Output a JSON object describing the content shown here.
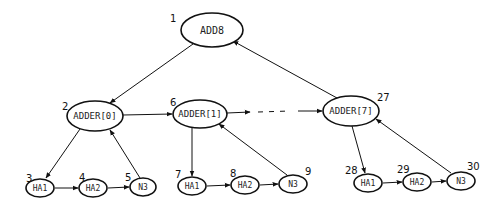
{
  "diagram": {
    "nodes": [
      {
        "id": "add8",
        "label": "ADD8",
        "number": "1",
        "cx": 212,
        "cy": 30,
        "rx": 31,
        "ry": 17,
        "num_x": 170,
        "num_y": 22,
        "font": 10
      },
      {
        "id": "adder0",
        "label": "ADDER[0]",
        "number": "2",
        "cx": 95,
        "cy": 116,
        "rx": 28,
        "ry": 15,
        "num_x": 62,
        "num_y": 110,
        "font": 9
      },
      {
        "id": "adder1",
        "label": "ADDER[1]",
        "number": "6",
        "cx": 200,
        "cy": 114,
        "rx": 27,
        "ry": 14,
        "num_x": 170,
        "num_y": 106,
        "font": 9
      },
      {
        "id": "adder7",
        "label": "ADDER[7]",
        "number": "27",
        "cx": 351,
        "cy": 111,
        "rx": 28,
        "ry": 15,
        "num_x": 377,
        "num_y": 101,
        "font": 9
      },
      {
        "id": "ha1_0",
        "label": "HA1",
        "number": "3",
        "cx": 40,
        "cy": 188,
        "rx": 14,
        "ry": 9,
        "num_x": 26,
        "num_y": 182,
        "font": 8
      },
      {
        "id": "ha2_0",
        "label": "HA2",
        "number": "4",
        "cx": 93,
        "cy": 188,
        "rx": 14,
        "ry": 9,
        "num_x": 79,
        "num_y": 181,
        "font": 8
      },
      {
        "id": "n3_0",
        "label": "N3",
        "number": "5",
        "cx": 143,
        "cy": 187,
        "rx": 13,
        "ry": 9,
        "num_x": 125,
        "num_y": 181,
        "font": 8
      },
      {
        "id": "ha1_1",
        "label": "HA1",
        "number": "7",
        "cx": 192,
        "cy": 186,
        "rx": 14,
        "ry": 9,
        "num_x": 175,
        "num_y": 178,
        "font": 8
      },
      {
        "id": "ha2_1",
        "label": "HA2",
        "number": "8",
        "cx": 245,
        "cy": 185,
        "rx": 14,
        "ry": 9,
        "num_x": 230,
        "num_y": 177,
        "font": 8
      },
      {
        "id": "n3_1",
        "label": "N3",
        "number": "9",
        "cx": 293,
        "cy": 184,
        "rx": 14,
        "ry": 9,
        "num_x": 305,
        "num_y": 175,
        "font": 8
      },
      {
        "id": "ha1_7",
        "label": "HA1",
        "number": "28",
        "cx": 368,
        "cy": 183,
        "rx": 14,
        "ry": 9,
        "num_x": 345,
        "num_y": 174,
        "font": 8
      },
      {
        "id": "ha2_7",
        "label": "HA2",
        "number": "29",
        "cx": 417,
        "cy": 182,
        "rx": 14,
        "ry": 9,
        "num_x": 397,
        "num_y": 173,
        "font": 8
      },
      {
        "id": "n3_7",
        "label": "N3",
        "number": "30",
        "cx": 461,
        "cy": 181,
        "rx": 14,
        "ry": 9,
        "num_x": 467,
        "num_y": 170,
        "font": 8
      }
    ],
    "edges": [
      {
        "from": "add8",
        "to": "adder0",
        "x1": 193,
        "y1": 44,
        "x2": 110,
        "y2": 103,
        "style": "solid"
      },
      {
        "from": "adder7",
        "to": "add8",
        "x1": 337,
        "y1": 98,
        "x2": 233,
        "y2": 41,
        "style": "solid"
      },
      {
        "from": "adder0",
        "to": "adder1",
        "x1": 123,
        "y1": 115,
        "x2": 172,
        "y2": 114,
        "style": "solid"
      },
      {
        "from": "adder1",
        "to": "dots",
        "x1": 227,
        "y1": 113,
        "x2": 250,
        "y2": 112,
        "style": "solid"
      },
      {
        "from": "dots",
        "to": "dots2",
        "x1": 258,
        "y1": 112,
        "x2": 290,
        "y2": 111,
        "style": "dashed"
      },
      {
        "from": "dots",
        "to": "adder7",
        "x1": 298,
        "y1": 111,
        "x2": 322,
        "y2": 111,
        "style": "solid"
      },
      {
        "from": "adder0",
        "to": "ha1_0",
        "x1": 80,
        "y1": 129,
        "x2": 46,
        "y2": 178,
        "style": "solid"
      },
      {
        "from": "ha1_0",
        "to": "ha2_0",
        "x1": 55,
        "y1": 188,
        "x2": 78,
        "y2": 188,
        "style": "solid"
      },
      {
        "from": "ha2_0",
        "to": "n3_0",
        "x1": 108,
        "y1": 188,
        "x2": 129,
        "y2": 187,
        "style": "solid"
      },
      {
        "from": "n3_0",
        "to": "adder0",
        "x1": 140,
        "y1": 178,
        "x2": 110,
        "y2": 130,
        "style": "solid"
      },
      {
        "from": "adder1",
        "to": "ha1_1",
        "x1": 192,
        "y1": 128,
        "x2": 192,
        "y2": 176,
        "style": "solid"
      },
      {
        "from": "ha1_1",
        "to": "ha2_1",
        "x1": 207,
        "y1": 186,
        "x2": 230,
        "y2": 185,
        "style": "solid"
      },
      {
        "from": "ha2_1",
        "to": "n3_1",
        "x1": 260,
        "y1": 185,
        "x2": 278,
        "y2": 184,
        "style": "solid"
      },
      {
        "from": "n3_1",
        "to": "adder1",
        "x1": 287,
        "y1": 175,
        "x2": 219,
        "y2": 124,
        "style": "solid"
      },
      {
        "from": "adder7",
        "to": "ha1_7",
        "x1": 352,
        "y1": 126,
        "x2": 365,
        "y2": 173,
        "style": "solid"
      },
      {
        "from": "ha1_7",
        "to": "ha2_7",
        "x1": 383,
        "y1": 183,
        "x2": 402,
        "y2": 182,
        "style": "solid"
      },
      {
        "from": "ha2_7",
        "to": "n3_7",
        "x1": 432,
        "y1": 182,
        "x2": 446,
        "y2": 181,
        "style": "solid"
      },
      {
        "from": "n3_7",
        "to": "adder7",
        "x1": 451,
        "y1": 173,
        "x2": 376,
        "y2": 119,
        "style": "solid"
      }
    ],
    "ellipsis": "- - - -"
  }
}
